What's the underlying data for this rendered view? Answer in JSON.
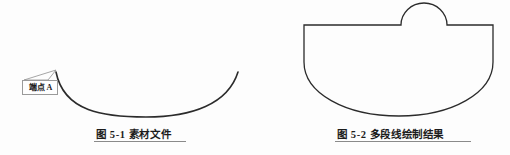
{
  "page": {
    "background_color": "#fdfdfd",
    "width": 510,
    "height": 155
  },
  "figures": [
    {
      "id": "figure-5-1",
      "caption": "图 5-1 素材文件",
      "annotation": {
        "label": "端点 A",
        "leader_target": "arc-left-endpoint"
      },
      "geometry": {
        "type": "open-arc",
        "stroke_color": "#2b2b2b",
        "start": [
          56,
          72
        ],
        "end": [
          238,
          72
        ],
        "lowest_point": [
          146,
          117
        ]
      }
    },
    {
      "id": "figure-5-2",
      "caption": "图 5-2 多段线绘制结果",
      "geometry": {
        "type": "closed-polyline-with-arcs",
        "stroke_color": "#2b2b2b",
        "top_left": [
          304,
          25
        ],
        "top_right": [
          493,
          25
        ],
        "bump_start": [
          401,
          25
        ],
        "bump_end": [
          447,
          25
        ],
        "bump_peak": [
          424,
          3
        ],
        "bottom_lowest": [
          399,
          116
        ]
      }
    }
  ],
  "colors": {
    "stroke": "#2b2b2b",
    "callout_border": "#9a9a9a",
    "rule": "#8a8a8a",
    "text": "#1c1c1c"
  }
}
